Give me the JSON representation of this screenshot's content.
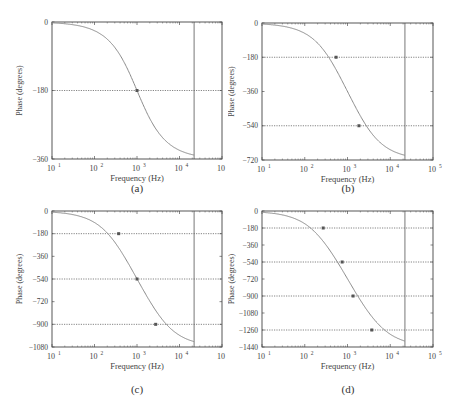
{
  "figure": {
    "panels": [
      {
        "id": "a",
        "caption": "(a)"
      },
      {
        "id": "b",
        "caption": "(b)"
      },
      {
        "id": "c",
        "caption": "(c)"
      },
      {
        "id": "d",
        "caption": "(d)"
      }
    ]
  },
  "chart_data": [
    {
      "type": "line",
      "panel": "(a)",
      "title": "",
      "xlabel": "Frequency (Hz)",
      "ylabel": "Phase (degrees)",
      "xscale": "log",
      "xlim": [
        10,
        100000
      ],
      "ylim": [
        -360,
        0
      ],
      "xticks": [
        "10^1",
        "10^2",
        "10^3",
        "10^4",
        "10^5"
      ],
      "yticks": [
        0,
        -180,
        -360
      ],
      "grid": "dotted horizontal at ytick multiples of -180",
      "vertical_marker_hz": 22050,
      "markers": [
        {
          "x": 1000,
          "y": -180
        }
      ],
      "series": [
        {
          "name": "phase",
          "x": [
            10,
            100,
            300,
            1000,
            3000,
            10000,
            22050
          ],
          "values": [
            -1,
            -11,
            -33,
            -180,
            -327,
            -349,
            -355
          ]
        }
      ]
    },
    {
      "type": "line",
      "panel": "(b)",
      "title": "",
      "xlabel": "Frequency (Hz)",
      "ylabel": "Phase (degrees)",
      "xscale": "log",
      "xlim": [
        10,
        100000
      ],
      "ylim": [
        -720,
        0
      ],
      "xticks": [
        "10^1",
        "10^2",
        "10^3",
        "10^4",
        "10^5"
      ],
      "yticks": [
        0,
        -180,
        -360,
        -540,
        -720
      ],
      "grid": "dotted horizontal at -180 and -540",
      "vertical_marker_hz": 22050,
      "markers": [
        {
          "x": 540,
          "y": -180
        },
        {
          "x": 1850,
          "y": -540
        }
      ],
      "series": [
        {
          "name": "phase",
          "x": [
            10,
            100,
            540,
            1000,
            1850,
            10000,
            22050
          ],
          "values": [
            -2,
            -25,
            -180,
            -360,
            -540,
            -690,
            -705
          ]
        }
      ]
    },
    {
      "type": "line",
      "panel": "(c)",
      "title": "",
      "xlabel": "Frequency (Hz)",
      "ylabel": "Phase (degrees)",
      "xscale": "log",
      "xlim": [
        10,
        100000
      ],
      "ylim": [
        -1080,
        0
      ],
      "xticks": [
        "10^1",
        "10^2",
        "10^3",
        "10^4",
        "10^5"
      ],
      "yticks": [
        0,
        -180,
        -360,
        -540,
        -720,
        -900,
        -1080
      ],
      "grid": "dotted horizontal at -180, -540, -900",
      "vertical_marker_hz": 22050,
      "markers": [
        {
          "x": 370,
          "y": -180
        },
        {
          "x": 1000,
          "y": -540
        },
        {
          "x": 2750,
          "y": -900
        }
      ],
      "series": [
        {
          "name": "phase",
          "x": [
            10,
            100,
            370,
            1000,
            2750,
            10000,
            22050
          ],
          "values": [
            -3,
            -40,
            -180,
            -540,
            -900,
            -1040,
            -1065
          ]
        }
      ]
    },
    {
      "type": "line",
      "panel": "(d)",
      "title": "",
      "xlabel": "Frequency (Hz)",
      "ylabel": "Phase (degrees)",
      "xscale": "log",
      "xlim": [
        10,
        100000
      ],
      "ylim": [
        -1440,
        0
      ],
      "xticks": [
        "10^1",
        "10^2",
        "10^3",
        "10^4",
        "10^5"
      ],
      "yticks": [
        0,
        -180,
        -360,
        -540,
        -720,
        -900,
        -1080,
        -1260,
        -1440
      ],
      "grid": "dotted horizontal at -180, -540, -900, -1260",
      "vertical_marker_hz": 22050,
      "markers": [
        {
          "x": 270,
          "y": -180
        },
        {
          "x": 750,
          "y": -540
        },
        {
          "x": 1350,
          "y": -900
        },
        {
          "x": 3700,
          "y": -1260
        }
      ],
      "series": [
        {
          "name": "phase",
          "x": [
            10,
            100,
            270,
            750,
            1000,
            1350,
            3700,
            10000,
            22050
          ],
          "values": [
            -4,
            -55,
            -180,
            -540,
            -720,
            -900,
            -1260,
            -1390,
            -1420
          ]
        }
      ]
    }
  ]
}
